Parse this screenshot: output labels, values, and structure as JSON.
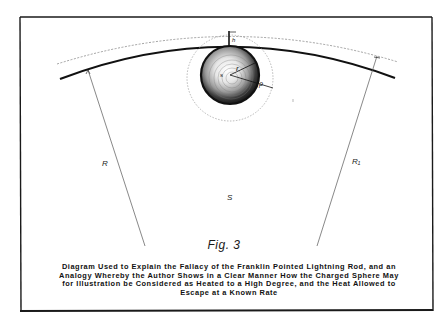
{
  "figure": {
    "title": "Fig. 3",
    "caption_lines": [
      "Diagram Used to Explain the Fallacy of the Franklin Pointed Lightning Rod, and an",
      "Analogy Whereby the Author Shows in a Clear Manner How the Charged Sphere May",
      "for Illustration be Considered as Heated to a High Degree, and the Heat Allowed to",
      "Escape at a Known Rate"
    ]
  },
  "diagram": {
    "labels": {
      "height": "h",
      "sphere_center": "s",
      "sphere_radius": "r",
      "outer_radius": "ρ",
      "earth_radius": "R",
      "outer_earth_radius": "R₁",
      "earth_surface": "S"
    },
    "colors": {
      "ink": "#1a1a1a",
      "dotted": "#8a8a8a",
      "paper": "#ffffff"
    }
  }
}
